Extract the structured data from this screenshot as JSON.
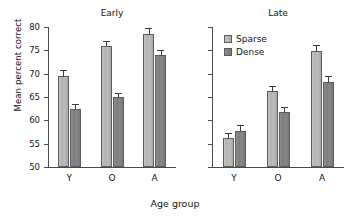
{
  "chart_data": {
    "type": "bar",
    "title": "",
    "xlabel": "Age group",
    "ylabel": "Mean percent correct",
    "ylim": [
      50,
      80
    ],
    "yticks": [
      50,
      55,
      60,
      65,
      70,
      75,
      80
    ],
    "ytick_labels": [
      "50",
      "55",
      "60",
      "65",
      "70",
      "75",
      "80"
    ],
    "grid": false,
    "legend_position": "top-left of right panel",
    "categories": [
      "Y",
      "O",
      "A"
    ],
    "legend": [
      "Sparse",
      "Dense"
    ],
    "panels": [
      {
        "name": "Early",
        "title": "Early",
        "categories": [
          "Y",
          "O",
          "A"
        ],
        "series": [
          {
            "name": "Sparse",
            "values": [
              69.5,
              76.0,
              78.5
            ],
            "errors": [
              1.2,
              1.1,
              1.2
            ]
          },
          {
            "name": "Dense",
            "values": [
              62.5,
              65.0,
              74.0
            ],
            "errors": [
              1.0,
              0.9,
              1.1
            ]
          }
        ]
      },
      {
        "name": "Late",
        "title": "Late",
        "categories": [
          "Y",
          "O",
          "A"
        ],
        "series": [
          {
            "name": "Sparse",
            "values": [
              56.3,
              66.3,
              74.8
            ],
            "errors": [
              1.0,
              1.1,
              1.3
            ]
          },
          {
            "name": "Dense",
            "values": [
              57.8,
              61.8,
              68.3
            ],
            "errors": [
              1.1,
              1.0,
              1.1
            ]
          }
        ]
      }
    ],
    "colors": {
      "sparse": "#b6b6b6",
      "dense": "#808080",
      "axis": "#4a4a4a",
      "text": "#141414",
      "background": "#ffffff"
    }
  },
  "axis": {
    "y_title": "Mean percent correct",
    "x_title": "Age group"
  },
  "legend": {
    "items": [
      {
        "label": "Sparse",
        "key": "sparse"
      },
      {
        "label": "Dense",
        "key": "dense"
      }
    ]
  }
}
